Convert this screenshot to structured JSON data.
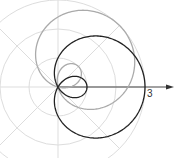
{
  "chart_data": {
    "type": "line",
    "subtype": "polar",
    "title": "",
    "xlabel": "",
    "ylabel": "",
    "origin_px": [
      58,
      87
    ],
    "px_per_unit": 29,
    "grid": {
      "on": true,
      "radii": [
        1,
        2,
        3
      ],
      "spoke_angles_deg": [
        0,
        45,
        90,
        135,
        180,
        225,
        270,
        315
      ],
      "color": "#dddddd"
    },
    "axis": {
      "x_label_tick": "3",
      "arrow": true,
      "color": "#444444"
    },
    "series": [
      {
        "name": "r = 1 + 2cos(θ - π/4)",
        "a": 1,
        "b": 2,
        "phase_deg": 45,
        "color": "#aaaaaa"
      },
      {
        "name": "r = 1 + 2cos(θ)",
        "a": 1,
        "b": 2,
        "phase_deg": 0,
        "color": "#222222"
      }
    ]
  }
}
